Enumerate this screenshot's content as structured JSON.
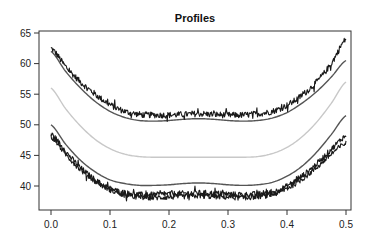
{
  "chart_data": {
    "type": "line",
    "title": "Profiles",
    "xlabel": "",
    "ylabel": "",
    "xlim": [
      -0.02,
      0.51
    ],
    "ylim": [
      35.9,
      65.3
    ],
    "xticks": [
      "0.0",
      "0.1",
      "0.2",
      "0.3",
      "0.4",
      "0.5"
    ],
    "yticks": [
      "40",
      "45",
      "50",
      "55",
      "60",
      "65"
    ],
    "grid": false,
    "legend": null,
    "x": [
      0.0,
      0.025,
      0.05,
      0.075,
      0.1,
      0.125,
      0.15,
      0.175,
      0.2,
      0.225,
      0.25,
      0.275,
      0.3,
      0.325,
      0.35,
      0.375,
      0.4,
      0.425,
      0.45,
      0.475,
      0.5
    ],
    "series": [
      {
        "name": "upper-noisy",
        "color": "#1a1a1a",
        "noisy": true,
        "noise": 0.5,
        "values": [
          62.5,
          59.5,
          57.0,
          55.0,
          53.3,
          52.2,
          51.7,
          51.6,
          51.6,
          51.7,
          51.8,
          51.7,
          51.6,
          51.6,
          51.8,
          52.2,
          53.2,
          54.8,
          57.0,
          60.0,
          64.0
        ]
      },
      {
        "name": "upper-smooth",
        "color": "#555555",
        "noisy": false,
        "values": [
          62.0,
          58.7,
          56.0,
          53.8,
          52.2,
          51.2,
          50.7,
          50.6,
          50.7,
          50.9,
          51.0,
          50.9,
          50.7,
          50.6,
          50.7,
          51.1,
          52.0,
          53.5,
          55.4,
          57.8,
          60.5
        ]
      },
      {
        "name": "middle-smooth",
        "color": "#c8c8c8",
        "noisy": false,
        "values": [
          56.0,
          52.6,
          49.8,
          47.6,
          46.1,
          45.2,
          44.8,
          44.7,
          44.7,
          44.7,
          44.7,
          44.7,
          44.7,
          44.7,
          44.8,
          45.3,
          46.3,
          48.0,
          50.4,
          53.5,
          57.0
        ]
      },
      {
        "name": "lower-smooth",
        "color": "#555555",
        "noisy": false,
        "values": [
          50.0,
          46.8,
          44.2,
          42.3,
          41.0,
          40.4,
          40.1,
          40.1,
          40.2,
          40.4,
          40.5,
          40.4,
          40.2,
          40.1,
          40.2,
          40.6,
          41.6,
          43.2,
          45.5,
          48.4,
          51.5
        ]
      },
      {
        "name": "lower-noisy-a",
        "color": "#1a1a1a",
        "noisy": true,
        "noise": 0.45,
        "values": [
          48.5,
          45.6,
          43.0,
          41.0,
          39.6,
          38.9,
          38.6,
          38.6,
          38.7,
          38.8,
          38.9,
          38.8,
          38.7,
          38.6,
          38.7,
          39.0,
          40.0,
          41.6,
          43.6,
          46.0,
          48.2
        ]
      },
      {
        "name": "lower-noisy-b",
        "color": "#1a1a1a",
        "noisy": true,
        "noise": 0.45,
        "values": [
          48.0,
          45.2,
          42.7,
          40.8,
          39.4,
          38.6,
          38.2,
          38.1,
          38.2,
          38.3,
          38.4,
          38.3,
          38.2,
          38.1,
          38.3,
          38.6,
          39.6,
          41.1,
          43.0,
          45.2,
          47.0
        ]
      }
    ]
  }
}
